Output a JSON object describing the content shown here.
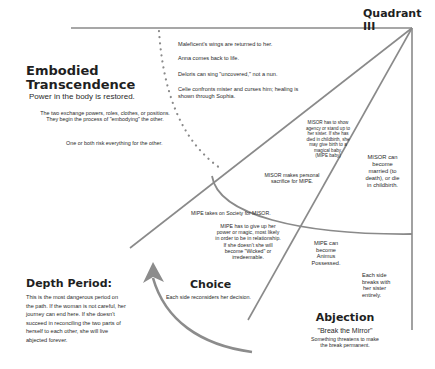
{
  "title": "Quadrant III",
  "colors": {
    "line": "#8a8a8a",
    "arrow": "#8c8c8c",
    "text": "#2a2a2a",
    "heading": "#1f1f1f"
  },
  "embodied": {
    "heading_line1": "Embodied",
    "heading_line2": "Transcendence",
    "subtitle": "Power in the body is restored.",
    "desc1_line1": "The two exchange powers, roles, clothes, or positions.",
    "desc1_line2": "They begin the process of \"embodying\" the other.",
    "desc2": "One or both risk everything for the other."
  },
  "examples": [
    "Maleficent's wings are returned to her.",
    "Anna comes back to life.",
    "Deloris can sing \"uncovered,\" not a nun.",
    "Celie confronts mister and curses him; healing is",
    "shown through Sophia."
  ],
  "misor_show": [
    "MISOR has to show",
    "agency or stand up to",
    "her sister.  If she has",
    "died in childbirth, she",
    "may give birth to a",
    "magical baby.",
    "(MIPE baby)"
  ],
  "misor_sacrifice": [
    "MISOR makes personal",
    "sacrifice for MIPE."
  ],
  "misor_married": [
    "MISOR can",
    "become",
    "married (to",
    "death), or die",
    "in childbirth."
  ],
  "mipe_society": "MIPE takes on Society for MISOR.",
  "mipe_give_up": [
    "MIPE has to give up her",
    "power or magic, most likely",
    "in order to be in relationship.",
    "If she doesn't she will",
    "become \"Wicked\" or",
    "irredeemable."
  ],
  "mipe_animus": [
    "MIPE can",
    "become",
    "Animus",
    "Possessed."
  ],
  "each_side_breaks": [
    "Each side",
    "breaks with",
    "her sister",
    "entirely."
  ],
  "choice": {
    "heading": "Choice",
    "desc": "Each side reconsiders her decision."
  },
  "abjection": {
    "heading": "Abjection",
    "subtitle": "\"Break the Mirror\"",
    "desc_line1": "Something threatens to make",
    "desc_line2": "the break permanent."
  },
  "depth": {
    "heading": "Depth Period:",
    "lines": [
      "This is the most dangerous period on",
      "the path.  If the woman is not careful, her",
      "journey can end here.  If she doesn't",
      "succeed in reconciling the two parts of",
      "herself to each other, she will live",
      "abjected forever."
    ]
  }
}
